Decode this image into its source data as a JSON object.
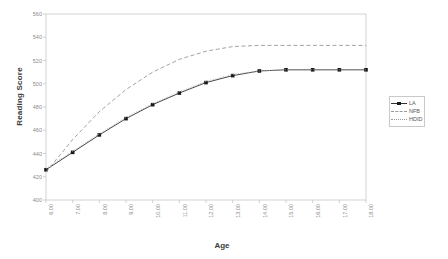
{
  "chart_data": {
    "type": "line",
    "title": "",
    "xlabel": "Age",
    "ylabel": "Reading Score",
    "xlim": [
      6,
      18
    ],
    "ylim": [
      400,
      560
    ],
    "grid": false,
    "legend_position": "right",
    "x": [
      6.0,
      7.0,
      8.0,
      9.0,
      10.0,
      11.0,
      12.0,
      13.0,
      14.0,
      15.0,
      16.0,
      17.0,
      18.0
    ],
    "xtick_labels": [
      "6.00",
      "7.00",
      "8.00",
      "9.00",
      "10.00",
      "11.00",
      "12.00",
      "13.00",
      "14.00",
      "15.00",
      "16.00",
      "17.00",
      "18.00"
    ],
    "ytick_labels": [
      "400",
      "420",
      "440",
      "460",
      "480",
      "500",
      "520",
      "540",
      "560"
    ],
    "ytick_values": [
      400,
      420,
      440,
      460,
      480,
      500,
      520,
      540,
      560
    ],
    "series": [
      {
        "name": "LA",
        "style": "solid",
        "marker": "square",
        "color": "#333333",
        "values": [
          426,
          441,
          456,
          470,
          482,
          492,
          501,
          507,
          511,
          512,
          512,
          512,
          512
        ]
      },
      {
        "name": "NFB",
        "style": "dashed",
        "marker": "none",
        "color": "#999999",
        "values": [
          424,
          452,
          476,
          495,
          510,
          521,
          528,
          532,
          533,
          533,
          533,
          533,
          533
        ]
      },
      {
        "name": "HDID",
        "style": "dotted",
        "marker": "none",
        "color": "#aaaaaa",
        "values": [
          427,
          442,
          457,
          471,
          483,
          493,
          502,
          508,
          511,
          512,
          512,
          512,
          512
        ]
      }
    ]
  },
  "legend": {
    "items": [
      {
        "label": "LA"
      },
      {
        "label": "NFB"
      },
      {
        "label": "HDID"
      }
    ]
  },
  "axes": {
    "y_title": "Reading Score",
    "x_title": "Age"
  }
}
